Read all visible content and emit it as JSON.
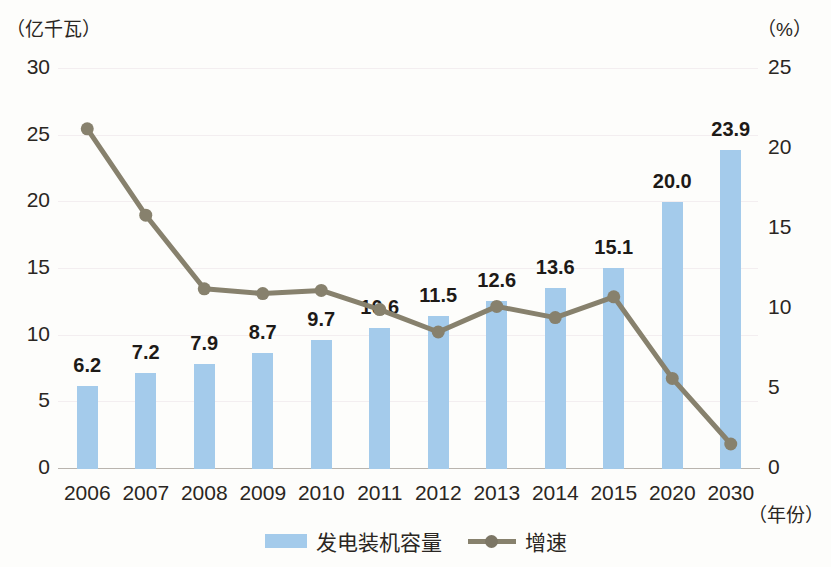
{
  "chart_data": {
    "type": "bar",
    "title": "",
    "xlabel": "（年份）",
    "ylabel": "（亿千瓦）",
    "y2label": "（%）",
    "ylim": [
      0,
      30
    ],
    "y2lim": [
      0,
      25
    ],
    "grid": true,
    "legend_position": "bottom",
    "categories": [
      "2006",
      "2007",
      "2008",
      "2009",
      "2010",
      "2011",
      "2012",
      "2013",
      "2014",
      "2015",
      "2020",
      "2030"
    ],
    "yticks": [
      "0",
      "5",
      "10",
      "15",
      "20",
      "25",
      "30"
    ],
    "y2ticks": [
      "0",
      "5",
      "10",
      "15",
      "20",
      "25"
    ],
    "series": [
      {
        "name": "发电装机容量",
        "type": "bar",
        "axis": "left",
        "unit": "亿千瓦",
        "color": "#a4cbeb",
        "values": [
          6.2,
          7.2,
          7.9,
          8.7,
          9.7,
          10.6,
          11.5,
          12.6,
          13.6,
          15.1,
          20.0,
          23.9
        ],
        "labels": [
          "6.2",
          "7.2",
          "7.9",
          "8.7",
          "9.7",
          "10.6",
          "11.5",
          "12.6",
          "13.6",
          "15.1",
          "20.0",
          "23.9"
        ]
      },
      {
        "name": "增速",
        "type": "line",
        "axis": "right",
        "unit": "%",
        "color": "#87816d",
        "values": [
          21.2,
          15.8,
          11.2,
          10.9,
          11.1,
          9.9,
          8.5,
          10.1,
          9.4,
          10.7,
          5.6,
          1.5
        ],
        "labels": [
          "",
          "",
          "",
          "",
          "",
          "",
          "",
          "",
          "",
          "",
          "",
          ""
        ]
      }
    ]
  },
  "legend": {
    "items": [
      {
        "label": "发电装机容量",
        "marker": "bar-swatch",
        "color": "#a4cbeb"
      },
      {
        "label": "增速",
        "marker": "line-marker",
        "color": "#87816d"
      }
    ]
  }
}
